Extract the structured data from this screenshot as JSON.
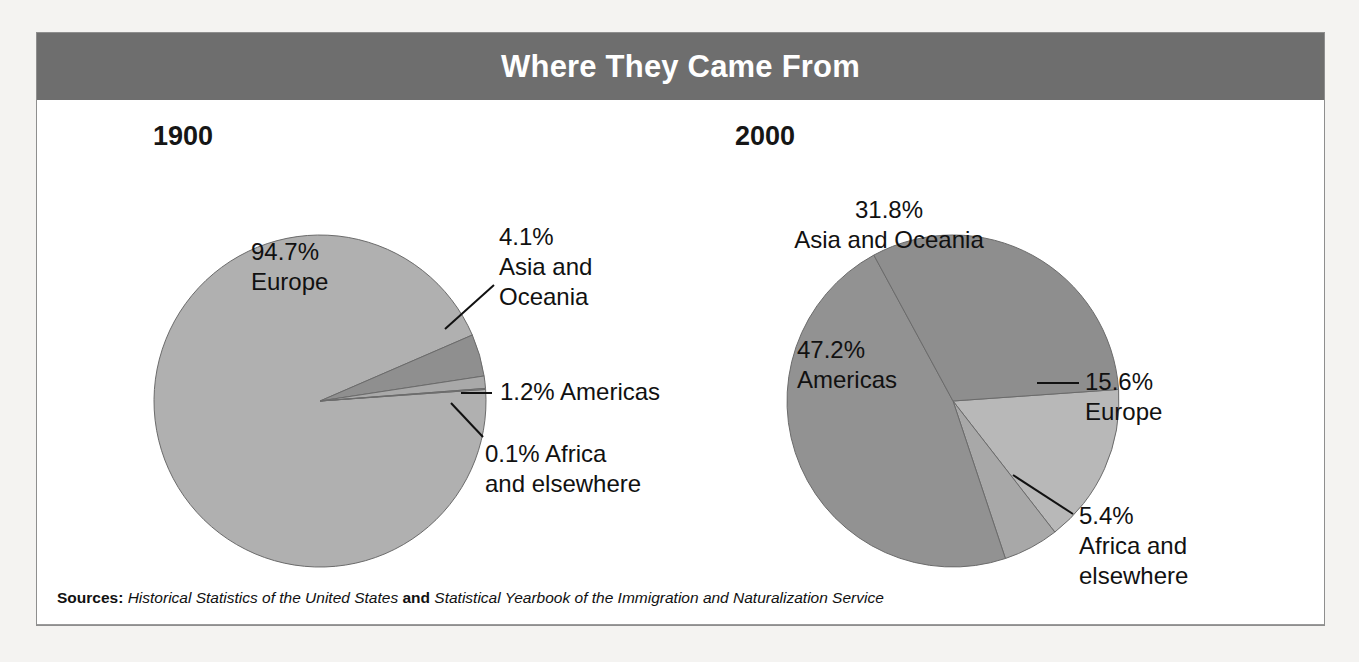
{
  "figure": {
    "title": "Where They Came From",
    "title_bar_color": "#6e6e6e",
    "frame_border_color": "#8e8e8e",
    "background_color": "#ffffff",
    "page_background": "#f4f3f1"
  },
  "source": {
    "label": "Sources:",
    "title_one": "Historical Statistics of the United States",
    "conjunction": "and",
    "title_two": "Statistical Yearbook of the Immigration and Naturalization Service"
  },
  "chart_data": [
    {
      "type": "pie",
      "title": "1900",
      "id": "pie-1900",
      "center": [
        283,
        301
      ],
      "radius": 166,
      "start_angle": -4,
      "categories": [
        "Europe",
        "Asia and Oceania",
        "Americas",
        "Africa and elsewhere"
      ],
      "values": [
        94.7,
        4.1,
        1.2,
        0.1
      ],
      "colors": [
        "#b0b0b0",
        "#8f8f8f",
        "#a9a9a9",
        "#9b9b9b"
      ],
      "labels": [
        {
          "percent": "94.7%",
          "name": "Europe",
          "lines": [
            "94.7%",
            "Europe"
          ],
          "x": 214,
          "y": 160,
          "anchor": "start",
          "inside": true,
          "leader": null
        },
        {
          "percent": "4.1%",
          "name": "Asia and Oceania",
          "lines": [
            "4.1%",
            "Asia and",
            "Oceania"
          ],
          "x": 462,
          "y": 145,
          "anchor": "start",
          "inside": false,
          "leader": [
            [
              457,
              185
            ],
            [
              408,
              229
            ]
          ]
        },
        {
          "percent": "1.2%",
          "name": "Americas",
          "lines": [
            "1.2% Americas"
          ],
          "x": 463,
          "y": 300,
          "anchor": "start",
          "inside": false,
          "leader": [
            [
              455,
              293
            ],
            [
              424,
              293
            ]
          ]
        },
        {
          "percent": "0.1%",
          "name": "Africa and elsewhere",
          "lines": [
            "0.1% Africa",
            "and elsewhere"
          ],
          "x": 448,
          "y": 362,
          "anchor": "start",
          "inside": false,
          "leader": [
            [
              446,
              337
            ],
            [
              414,
              303
            ]
          ]
        }
      ],
      "year_label_pos": [
        116,
        45
      ]
    },
    {
      "type": "pie",
      "title": "2000",
      "id": "pie-2000",
      "center": [
        916,
        301
      ],
      "radius": 166,
      "start_angle": -4,
      "categories": [
        "Europe",
        "Africa and elsewhere",
        "Americas",
        "Asia and Oceania"
      ],
      "values": [
        15.6,
        5.4,
        47.2,
        31.8
      ],
      "colors": [
        "#b8b8b8",
        "#a8a8a8",
        "#929292",
        "#8e8e8e"
      ],
      "labels": [
        {
          "percent": "31.8%",
          "name": "Asia and Oceania",
          "lines": [
            "31.8%",
            "Asia and Oceania"
          ],
          "x": 852,
          "y": 118,
          "anchor": "middle",
          "inside": true,
          "leader": null
        },
        {
          "percent": "15.6%",
          "name": "Europe",
          "lines": [
            "15.6%",
            "Europe"
          ],
          "x": 1048,
          "y": 290,
          "anchor": "start",
          "inside": false,
          "leader": [
            [
              1042,
              283
            ],
            [
              1000,
              283
            ]
          ]
        },
        {
          "percent": "5.4%",
          "name": "Africa and elsewhere",
          "lines": [
            "5.4%",
            "Africa and",
            "elsewhere"
          ],
          "x": 1042,
          "y": 424,
          "anchor": "start",
          "inside": false,
          "leader": [
            [
              1036,
              414
            ],
            [
              976,
              375
            ]
          ]
        },
        {
          "percent": "47.2%",
          "name": "Americas",
          "lines": [
            "47.2%",
            "Americas"
          ],
          "x": 760,
          "y": 258,
          "anchor": "start",
          "inside": true,
          "leader": null
        }
      ],
      "year_label_pos": [
        698,
        45
      ]
    }
  ]
}
